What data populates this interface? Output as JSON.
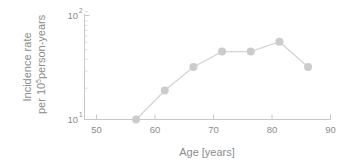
{
  "chart_data": {
    "type": "line",
    "title": "",
    "subtitle": "",
    "xlabel": "Age [years]",
    "ylabel_line1": "Incidence rate",
    "ylabel_line2_pre": "per 10",
    "ylabel_line2_exp": "5",
    "ylabel_line2_post": " person-years",
    "x": [
      57,
      62,
      67,
      72,
      77,
      82,
      87
    ],
    "values": [
      10,
      19,
      32,
      45,
      45,
      56,
      32
    ],
    "xlim": [
      48,
      91
    ],
    "ylim": [
      9,
      115
    ],
    "yscale": "log",
    "xscale": "linear",
    "xticks": [
      50,
      60,
      70,
      80,
      90
    ],
    "xticklabels": [
      "50",
      "60",
      "70",
      "80",
      "90"
    ],
    "yticks": [
      10,
      100
    ],
    "yticklabels": [
      {
        "base": "10",
        "exp": "1"
      },
      {
        "base": "10",
        "exp": "2"
      }
    ],
    "yminorticks": [
      20,
      30,
      40,
      50,
      60,
      70,
      80,
      90
    ],
    "grid": false,
    "legend": null,
    "marker": "circle",
    "marker_size": 8,
    "series_color": "#cccccc",
    "line_color": "#d4d4d4",
    "axis_color": "#c8c8c8",
    "text_color": "#8c8c8c"
  },
  "axis_tick_text": {
    "x_50": "50",
    "x_60": "60",
    "x_70": "70",
    "x_80": "80",
    "x_90": "90",
    "y_10_base": "10",
    "y_10_exp": "1",
    "y_100_base": "10",
    "y_100_exp": "2"
  }
}
